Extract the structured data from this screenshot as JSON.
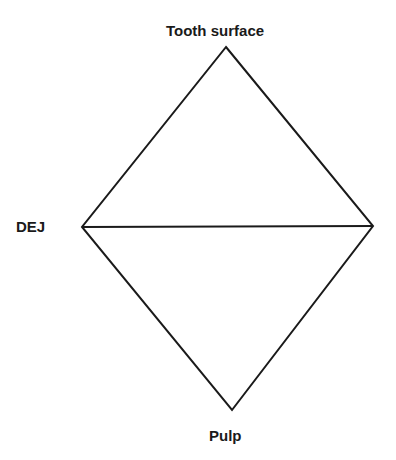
{
  "diagram": {
    "type": "rhombus-split",
    "labels": {
      "top": "Tooth surface",
      "left": "DEJ",
      "bottom": "Pulp"
    },
    "vertices": {
      "top": [
        226,
        47
      ],
      "left": [
        82,
        227
      ],
      "right": [
        373,
        226
      ],
      "bottom": [
        232,
        410
      ]
    },
    "line_color": "#1a1a1a"
  }
}
